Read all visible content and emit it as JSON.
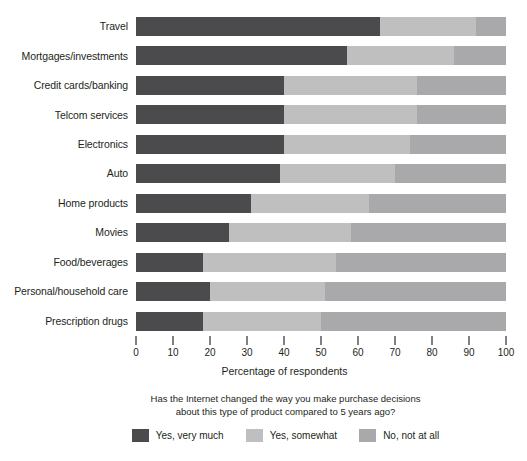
{
  "chart_data": {
    "type": "bar",
    "orientation": "horizontal",
    "stacked": true,
    "stack_total": 100,
    "title": "",
    "xlabel": "Percentage of respondents",
    "ylabel": "",
    "xlim": [
      0,
      100
    ],
    "xticks": [
      0,
      10,
      20,
      30,
      40,
      50,
      60,
      70,
      80,
      90,
      100
    ],
    "xtick_labels": [
      "0",
      "10",
      "20",
      "30",
      "40",
      "50",
      "60",
      "70",
      "80",
      "90",
      "100"
    ],
    "grid": false,
    "legend_position": "bottom",
    "legend_title": "Has the Internet changed the way you make purchase decisions about this type of product compared to 5 years ago?",
    "categories": [
      "Travel",
      "Mortgages/investments",
      "Credit cards/banking",
      "Telcom services",
      "Electronics",
      "Auto",
      "Home products",
      "Movies",
      "Food/beverages",
      "Personal/household care",
      "Prescription drugs"
    ],
    "series": [
      {
        "name": "Yes, very much",
        "color": "#4b4b4d",
        "values": [
          66,
          57,
          40,
          40,
          40,
          39,
          31,
          25,
          18,
          20,
          18
        ]
      },
      {
        "name": "Yes, somewhat",
        "color": "#bfbfc0",
        "values": [
          26,
          29,
          36,
          36,
          34,
          31,
          32,
          33,
          36,
          31,
          32
        ]
      },
      {
        "name": "No, not at all",
        "color": "#a9a9ab",
        "values": [
          8,
          14,
          24,
          24,
          26,
          30,
          37,
          42,
          46,
          49,
          50
        ]
      }
    ]
  },
  "legend": {
    "question_line_1": "Has the Internet changed the way you make purchase decisions",
    "question_line_2": "about this type of product compared to 5 years ago?",
    "items": [
      {
        "label": "Yes, very much",
        "color": "#4b4b4d"
      },
      {
        "label": "Yes, somewhat",
        "color": "#bfbfc0"
      },
      {
        "label": "No, not at all",
        "color": "#a9a9ab"
      }
    ]
  },
  "axis": {
    "x_title": "Percentage of respondents"
  }
}
